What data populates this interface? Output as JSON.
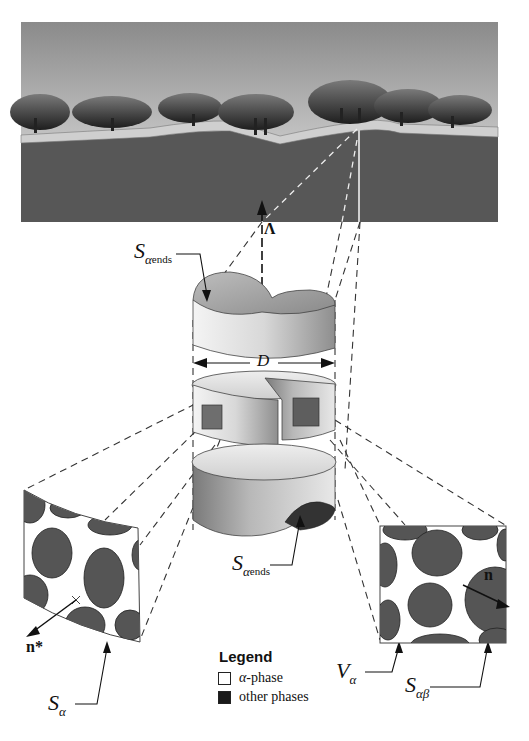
{
  "figure": {
    "labels": {
      "lambda": "Λ",
      "diameter": "D",
      "s_alpha_ends_top": {
        "main": "S",
        "sub": "α",
        "subsub": "ends"
      },
      "s_alpha_ends_bottom": {
        "main": "S",
        "sub": "α",
        "subsub": "ends"
      },
      "s_alpha": {
        "main": "S",
        "sub": "α"
      },
      "v_alpha": {
        "main": "V",
        "sub": "α"
      },
      "s_alpha_beta": {
        "main": "S",
        "sub": "αβ"
      },
      "n_star": "n*",
      "n": "n"
    },
    "legend": {
      "title": "Legend",
      "items": [
        {
          "swatch_color": "#ffffff",
          "prefix": "α",
          "label": "-phase"
        },
        {
          "swatch_color": "#1a1a1a",
          "prefix": "",
          "label": "other phases"
        }
      ]
    },
    "colors": {
      "sky_top": "#8a8a8a",
      "sky_bottom": "#e6e6e6",
      "ground": "#555555",
      "tree": "#2e2e2e",
      "phase_other": "#555555",
      "phase_alpha": "#ffffff",
      "cylinder_light": "#e8e8e8",
      "cylinder_dark": "#8a8a8a"
    }
  }
}
